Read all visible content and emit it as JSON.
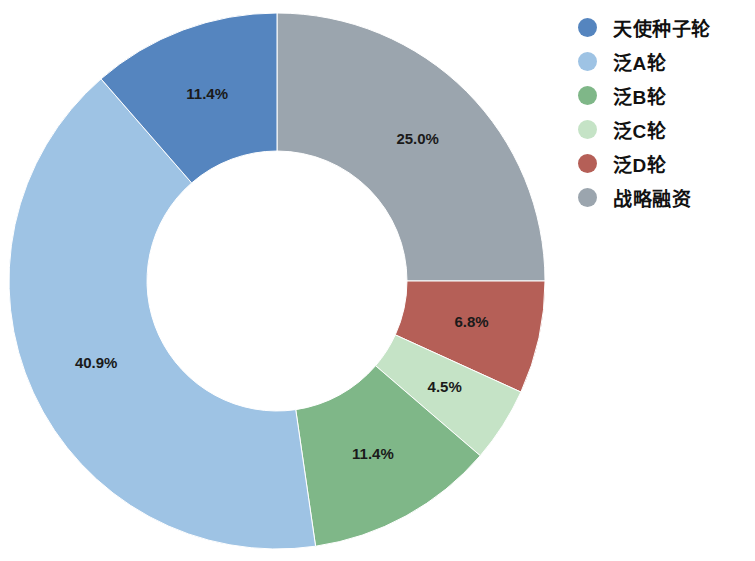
{
  "chart_data": {
    "type": "pie",
    "variant": "donut",
    "title": "",
    "subtitle": "",
    "xlabel": "",
    "ylabel": "",
    "grid": false,
    "legend_position": "right",
    "start_angle_deg": 0,
    "direction": "clockwise",
    "hole_ratio": 0.485,
    "center": {
      "x": 277,
      "y": 281
    },
    "outer_radius": 268,
    "categories": [
      "天使种子轮",
      "泛A轮",
      "泛B轮",
      "泛C轮",
      "泛D轮",
      "战略融资"
    ],
    "values": [
      11.4,
      40.9,
      11.4,
      4.5,
      6.8,
      25.0
    ],
    "value_labels": [
      "11.4%",
      "40.9%",
      "11.4%",
      "4.5%",
      "6.8%",
      "25.0%"
    ],
    "colors": [
      "#5585bf",
      "#9ec3e4",
      "#7fb788",
      "#c5e3c6",
      "#b55f57",
      "#9ba5ae"
    ],
    "slices": [
      {
        "label": "战略融资",
        "value": 25.0,
        "value_label": "25.0%",
        "color": "#9ba5ae",
        "legend_index": 5
      },
      {
        "label": "泛D轮",
        "value": 6.8,
        "value_label": "6.8%",
        "color": "#b55f57",
        "legend_index": 4
      },
      {
        "label": "泛C轮",
        "value": 4.5,
        "value_label": "4.5%",
        "color": "#c5e3c6",
        "legend_index": 3
      },
      {
        "label": "泛B轮",
        "value": 11.4,
        "value_label": "11.4%",
        "color": "#7fb788",
        "legend_index": 2
      },
      {
        "label": "泛A轮",
        "value": 40.9,
        "value_label": "40.9%",
        "color": "#9ec3e4",
        "legend_index": 1
      },
      {
        "label": "天使种子轮",
        "value": 11.4,
        "value_label": "11.4%",
        "color": "#5585bf",
        "legend_index": 0
      }
    ]
  },
  "legend": {
    "items": [
      {
        "label": "天使种子轮",
        "color": "#5585bf"
      },
      {
        "label": "泛A轮",
        "color": "#9ec3e4"
      },
      {
        "label": "泛B轮",
        "color": "#7fb788"
      },
      {
        "label": "泛C轮",
        "color": "#c5e3c6"
      },
      {
        "label": "泛D轮",
        "color": "#b55f57"
      },
      {
        "label": "战略融资",
        "color": "#9ba5ae"
      }
    ]
  }
}
